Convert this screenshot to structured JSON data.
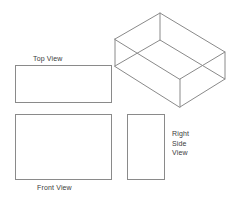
{
  "drawing": {
    "title": "Orthographic Projection of a Rectangular Open Box",
    "background_color": "#ffffff",
    "line_color": "#8a8a8a",
    "text_color": "#3b3b3b",
    "views": [
      {
        "id": "top-view",
        "label": "Top View",
        "shape": "rectangle",
        "label_position": "above",
        "x": 15,
        "y": 65,
        "width": 97,
        "height": 38
      },
      {
        "id": "front-view",
        "label": "Front View",
        "shape": "rectangle",
        "label_position": "below",
        "x": 15,
        "y": 114,
        "width": 97,
        "height": 66
      },
      {
        "id": "right-side-view",
        "label_lines": [
          "Right",
          "Side",
          "View"
        ],
        "label": "Right Side View",
        "shape": "rectangle",
        "label_position": "right",
        "x": 127,
        "y": 114,
        "width": 38,
        "height": 66
      }
    ],
    "pictorial": {
      "id": "isometric-box",
      "type": "isometric",
      "description": "open-top rectangular box",
      "x": 105,
      "y": 5,
      "width": 135,
      "height": 115,
      "vertices": {
        "top_back": [
          55,
          8
        ],
        "top_left": [
          10,
          34
        ],
        "top_right": [
          120,
          47
        ],
        "top_front": [
          75,
          74
        ],
        "bottom_left": [
          10,
          61
        ],
        "bottom_right": [
          120,
          74
        ],
        "bottom_front": [
          75,
          102
        ],
        "bottom_back": [
          55,
          35
        ]
      }
    }
  },
  "labels": {
    "top_view": "Top View",
    "front_view": "Front View",
    "right_side_1": "Right",
    "right_side_2": "Side",
    "right_side_3": "View"
  }
}
